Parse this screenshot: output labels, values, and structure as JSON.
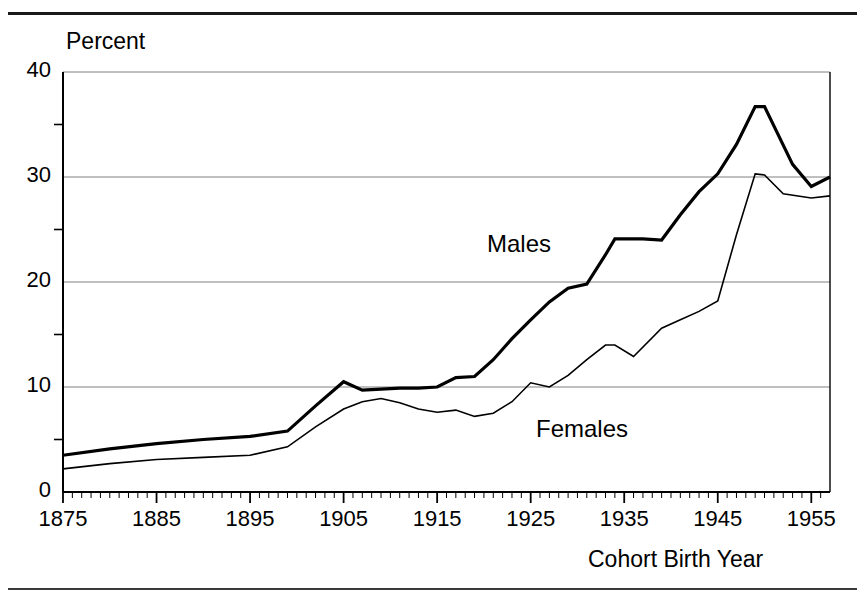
{
  "page": {
    "background_color": "#ffffff",
    "line_color": "#000000",
    "gridline_color": "#808080",
    "top_rule": true,
    "bottom_rule": true,
    "clipped_header_text": ""
  },
  "chart_data": {
    "type": "line",
    "title": "",
    "xlabel": "Cohort Birth Year",
    "ylabel": "Percent",
    "xlim": [
      1875,
      1957
    ],
    "ylim": [
      0,
      40
    ],
    "yticks": [
      0,
      10,
      20,
      30,
      40
    ],
    "ytick_labels": [
      "0",
      "10",
      "20",
      "30",
      "40"
    ],
    "y_minor_ticks": [
      5,
      15,
      25,
      35
    ],
    "xticks": [
      1875,
      1885,
      1895,
      1905,
      1915,
      1925,
      1935,
      1945,
      1955
    ],
    "xtick_labels": [
      "1875",
      "1885",
      "1895",
      "1905",
      "1915",
      "1925",
      "1935",
      "1945",
      "1955"
    ],
    "x_minor_tick_interval": 1,
    "grid": "horizontal",
    "gridlines_at": [
      10,
      20,
      30,
      40
    ],
    "legend": "inline-annotations",
    "series": [
      {
        "name": "Males",
        "label": "Males",
        "label_position": {
          "x": 1921,
          "y": 23.5
        },
        "line_width": 3.2,
        "x": [
          1875,
          1880,
          1885,
          1890,
          1895,
          1899,
          1902,
          1905,
          1907,
          1909,
          1911,
          1913,
          1915,
          1917,
          1919,
          1921,
          1923,
          1925,
          1927,
          1929,
          1931,
          1933,
          1934,
          1937,
          1939,
          1941,
          1943,
          1945,
          1947,
          1949,
          1950,
          1953,
          1955,
          1957
        ],
        "y": [
          3.5,
          4.1,
          4.6,
          5.0,
          5.3,
          5.8,
          8.2,
          10.5,
          9.7,
          9.8,
          9.9,
          9.9,
          10.0,
          10.9,
          11.0,
          12.6,
          14.6,
          16.4,
          18.1,
          19.4,
          19.8,
          22.6,
          24.1,
          24.1,
          24.0,
          26.4,
          28.6,
          30.3,
          33.1,
          36.7,
          36.7,
          31.2,
          29.1,
          30.0
        ]
      },
      {
        "name": "Females",
        "label": "Females",
        "label_position": {
          "x": 1926,
          "y": 6.3
        },
        "line_width": 1.6,
        "x": [
          1875,
          1880,
          1885,
          1890,
          1895,
          1899,
          1902,
          1905,
          1907,
          1909,
          1911,
          1913,
          1915,
          1917,
          1919,
          1921,
          1923,
          1925,
          1927,
          1929,
          1931,
          1933,
          1934,
          1936,
          1939,
          1941,
          1943,
          1945,
          1947,
          1949,
          1950,
          1952,
          1955,
          1957
        ],
        "y": [
          2.2,
          2.7,
          3.1,
          3.3,
          3.5,
          4.3,
          6.2,
          7.9,
          8.6,
          8.9,
          8.5,
          7.9,
          7.6,
          7.8,
          7.2,
          7.5,
          8.6,
          10.4,
          10.0,
          11.1,
          12.6,
          14.0,
          14.0,
          12.9,
          15.6,
          16.4,
          17.2,
          18.2,
          24.5,
          30.3,
          30.2,
          28.4,
          28.0,
          28.2
        ]
      }
    ]
  }
}
